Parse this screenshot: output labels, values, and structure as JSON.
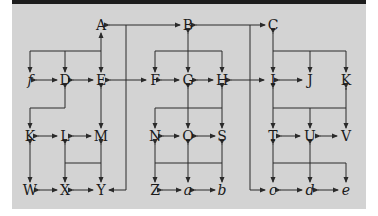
{
  "diagram": {
    "colors": {
      "panel": "#d3d3d3",
      "topbar": "#1c1c1c",
      "line": "#2a2a2a",
      "text": "#1a1a1a"
    },
    "nodes": [
      {
        "id": "A",
        "label": "A",
        "x": 101,
        "y": 25,
        "italic": false
      },
      {
        "id": "B",
        "label": "B",
        "x": 188,
        "y": 25,
        "italic": false
      },
      {
        "id": "C",
        "label": "C",
        "x": 273,
        "y": 25,
        "italic": false
      },
      {
        "id": "f",
        "label": "f",
        "x": 30,
        "y": 80,
        "italic": true
      },
      {
        "id": "D",
        "label": "D",
        "x": 65,
        "y": 80,
        "italic": false
      },
      {
        "id": "E",
        "label": "E",
        "x": 101,
        "y": 80,
        "italic": false
      },
      {
        "id": "F",
        "label": "F",
        "x": 155,
        "y": 80,
        "italic": false
      },
      {
        "id": "G",
        "label": "G",
        "x": 188,
        "y": 80,
        "italic": false
      },
      {
        "id": "H",
        "label": "H",
        "x": 222,
        "y": 80,
        "italic": false
      },
      {
        "id": "I",
        "label": "I",
        "x": 273,
        "y": 80,
        "italic": false
      },
      {
        "id": "J",
        "label": "J",
        "x": 310,
        "y": 80,
        "italic": false
      },
      {
        "id": "K1",
        "label": "K",
        "x": 346,
        "y": 80,
        "italic": false
      },
      {
        "id": "K2",
        "label": "K",
        "x": 30,
        "y": 136,
        "italic": false
      },
      {
        "id": "L",
        "label": "L",
        "x": 65,
        "y": 136,
        "italic": false
      },
      {
        "id": "M",
        "label": "M",
        "x": 101,
        "y": 136,
        "italic": false
      },
      {
        "id": "N",
        "label": "N",
        "x": 155,
        "y": 136,
        "italic": false
      },
      {
        "id": "O",
        "label": "O",
        "x": 188,
        "y": 136,
        "italic": false
      },
      {
        "id": "S",
        "label": "S",
        "x": 222,
        "y": 136,
        "italic": false
      },
      {
        "id": "T",
        "label": "T",
        "x": 273,
        "y": 136,
        "italic": false
      },
      {
        "id": "U",
        "label": "U",
        "x": 310,
        "y": 136,
        "italic": false
      },
      {
        "id": "V",
        "label": "V",
        "x": 346,
        "y": 136,
        "italic": false
      },
      {
        "id": "W",
        "label": "W",
        "x": 30,
        "y": 190,
        "italic": false
      },
      {
        "id": "X",
        "label": "X",
        "x": 65,
        "y": 190,
        "italic": false
      },
      {
        "id": "Y",
        "label": "Y",
        "x": 101,
        "y": 190,
        "italic": false
      },
      {
        "id": "Z",
        "label": "Z",
        "x": 155,
        "y": 190,
        "italic": false
      },
      {
        "id": "a",
        "label": "a",
        "x": 188,
        "y": 190,
        "italic": true
      },
      {
        "id": "b",
        "label": "b",
        "x": 222,
        "y": 190,
        "italic": true
      },
      {
        "id": "c",
        "label": "c",
        "x": 273,
        "y": 190,
        "italic": true
      },
      {
        "id": "d",
        "label": "d",
        "x": 310,
        "y": 190,
        "italic": true
      },
      {
        "id": "e",
        "label": "e",
        "x": 346,
        "y": 190,
        "italic": true
      }
    ]
  }
}
